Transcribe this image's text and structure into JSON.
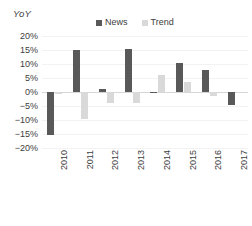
{
  "chart_data": {
    "type": "bar",
    "title": "",
    "subtitle": "",
    "xlabel": "",
    "ylabel": "YoY",
    "categories": [
      "2010",
      "2011",
      "2012",
      "2013",
      "2014",
      "2015",
      "2016",
      "2017"
    ],
    "series": [
      {
        "name": "News",
        "color": "#595959",
        "values": [
          -15.5,
          15.0,
          1.0,
          15.5,
          -0.5,
          10.5,
          8.0,
          -4.5
        ]
      },
      {
        "name": "Trend",
        "color": "#d9d9d9",
        "values": [
          -0.8,
          -9.8,
          -4.0,
          -4.0,
          6.0,
          3.5,
          -1.5,
          -0.2
        ]
      }
    ],
    "ylim": [
      -20,
      20
    ],
    "ytick_values": [
      20,
      15,
      10,
      5,
      0,
      -5,
      -10,
      -15,
      -20
    ],
    "ytick_labels": [
      "20%",
      "15%",
      "10%",
      "5%",
      "0%",
      "−5%",
      "−10%",
      "−15%",
      "−20%"
    ],
    "grid": true,
    "legend_position": "top-center",
    "xtick_rotation": -90
  },
  "legend": {
    "items": [
      {
        "label": "News",
        "color": "#595959"
      },
      {
        "label": "Trend",
        "color": "#d9d9d9"
      }
    ]
  },
  "axis": {
    "y_title": "YoY"
  },
  "colors": {
    "news": "#595959",
    "trend": "#d9d9d9",
    "gridline": "#f2f2f2",
    "zeroline": "#d6d6d6",
    "text": "#404040",
    "background": "#ffffff"
  }
}
